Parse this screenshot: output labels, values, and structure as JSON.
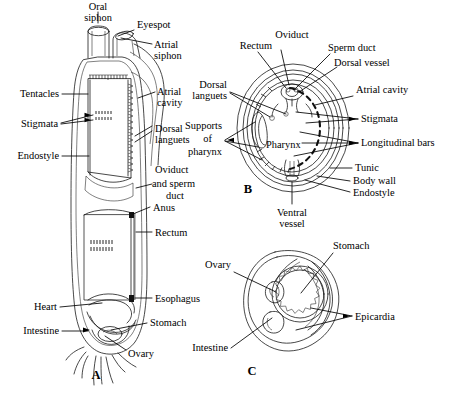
{
  "figure": {
    "background_color": "#ffffff",
    "ink_color": "#000000",
    "panels": [
      {
        "letter": "A",
        "name": "whole-animal-longitudinal-section",
        "labels": [
          "Oral siphon",
          "Eyespot",
          "Atrial siphon",
          "Tentacles",
          "Atrial cavity",
          "Stigmata",
          "Dorsal languets",
          "Endostyle",
          "Oviduct and sperm duct",
          "Anus",
          "Rectum",
          "Heart",
          "Esophagus",
          "Intestine",
          "Stomach",
          "Ovary"
        ]
      },
      {
        "letter": "B",
        "name": "pharynx-cross-section",
        "labels": [
          "Rectum",
          "Oviduct",
          "Sperm duct",
          "Dorsal vessel",
          "Dorsal languets",
          "Atrial cavity",
          "Stigmata",
          "Supports of pharynx",
          "Longitudinal bars",
          "Pharynx",
          "Tunic",
          "Body wall",
          "Endostyle",
          "Ventral vessel"
        ]
      },
      {
        "letter": "C",
        "name": "abdomen-cross-section",
        "labels": [
          "Ovary",
          "Stomach",
          "Epicardia",
          "Intestine"
        ]
      }
    ]
  },
  "panelA": {
    "letter": "A",
    "labels": {
      "oral_siphon_l1": "Oral",
      "oral_siphon_l2": "siphon",
      "eyespot": "Eyespot",
      "atrial_siphon_l1": "Atrial",
      "atrial_siphon_l2": "siphon",
      "tentacles": "Tentacles",
      "atrial_cavity_l1": "Atrial",
      "atrial_cavity_l2": "cavity",
      "stigmata": "Stigmata",
      "dorsal_languets_l1": "Dorsal",
      "dorsal_languets_l2": "languets",
      "endostyle": "Endostyle",
      "oviduct_l1": "Oviduct",
      "oviduct_l2": "and  sperm",
      "oviduct_l3": "duct",
      "anus": "Anus",
      "rectum": "Rectum",
      "heart": "Heart",
      "esophagus": "Esophagus",
      "intestine": "Intestine",
      "stomach": "Stomach",
      "ovary": "Ovary"
    }
  },
  "panelB": {
    "letter": "B",
    "labels": {
      "rectum": "Rectum",
      "oviduct": "Oviduct",
      "sperm_duct": "Sperm duct",
      "dorsal_vessel": "Dorsal vessel",
      "dorsal_languets_l1": "Dorsal",
      "dorsal_languets_l2": "languets",
      "atrial_cavity": "Atrial cavity",
      "stigmata": "Stigmata",
      "supports_l1": "Supports",
      "supports_l2": "of",
      "supports_l3": "pharynx",
      "longitudinal_bars": "Longitudinal bars",
      "pharynx": "Pharynx",
      "tunic": "Tunic",
      "body_wall": "Body  wall",
      "endostyle": "Endostyle",
      "ventral_vessel_l1": "Ventral",
      "ventral_vessel_l2": "vessel"
    }
  },
  "panelC": {
    "letter": "C",
    "labels": {
      "ovary": "Ovary",
      "stomach": "Stomach",
      "epicardia": "Epicardia",
      "intestine": "Intestine"
    }
  }
}
